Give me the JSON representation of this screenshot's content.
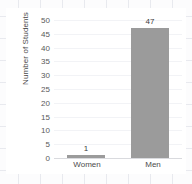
{
  "chart_data": {
    "type": "bar",
    "title": "",
    "xlabel": "",
    "ylabel": "Number of Students",
    "categories": [
      "Women",
      "Men"
    ],
    "values": [
      1,
      47
    ],
    "data_labels": [
      "1",
      "47"
    ],
    "ylim": [
      0,
      50
    ],
    "ytick_labels": [
      "50",
      "45",
      "40",
      "35",
      "30",
      "25",
      "20",
      "15",
      "10",
      "5",
      "0"
    ],
    "ytick_values": [
      50,
      45,
      40,
      35,
      30,
      25,
      20,
      15,
      10,
      5,
      0
    ],
    "grid": true,
    "legend": false,
    "bar_color": "#9b9b9b",
    "text_color": "#4c4c4c",
    "background_color": "#ffffff"
  }
}
